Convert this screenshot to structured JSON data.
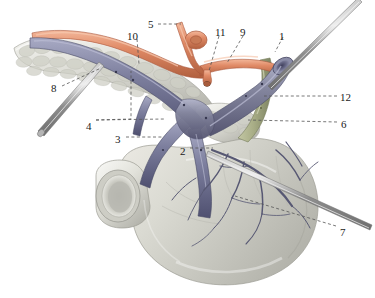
{
  "figure": {
    "background_color": "#ffffff",
    "width": 375,
    "height": 298
  },
  "palette": {
    "artery": "#e08a66",
    "artery_shadow": "#b8603f",
    "artery_highlight": "#f0b093",
    "vein": "#7d7f9e",
    "vein_shadow": "#4e4f6b",
    "vein_highlight": "#a6a8c2",
    "bile_duct": "#a8ad86",
    "bile_duct_shadow": "#7e8462",
    "organ": "#d9d9d2",
    "organ_shadow": "#b0b0a8",
    "organ_highlight": "#f2f2ee",
    "pancreas_lobule": "#cfd0c6",
    "probe": "#9a9a9a",
    "probe_highlight": "#dcdcdc",
    "leader_line": "#555555",
    "label_text": "#1a1a1a"
  },
  "labels": [
    {
      "id": "label-5",
      "text": "5",
      "x": 148,
      "y": 19
    },
    {
      "id": "label-10",
      "text": "10",
      "x": 127,
      "y": 31
    },
    {
      "id": "label-11",
      "text": "11",
      "x": 215,
      "y": 27
    },
    {
      "id": "label-9",
      "text": "9",
      "x": 240,
      "y": 27
    },
    {
      "id": "label-1",
      "text": "1",
      "x": 279,
      "y": 31
    },
    {
      "id": "label-12",
      "text": "12",
      "x": 340,
      "y": 92
    },
    {
      "id": "label-6",
      "text": "6",
      "x": 341,
      "y": 119
    },
    {
      "id": "label-8",
      "text": "8",
      "x": 51,
      "y": 83
    },
    {
      "id": "label-4",
      "text": "4",
      "x": 86,
      "y": 121
    },
    {
      "id": "label-3",
      "text": "3",
      "x": 115,
      "y": 134
    },
    {
      "id": "label-2",
      "text": "2",
      "x": 180,
      "y": 146
    },
    {
      "id": "label-7",
      "text": "7",
      "x": 340,
      "y": 227
    }
  ],
  "leader_lines": [
    {
      "id": "leader-5",
      "points": "158,24 181,24"
    },
    {
      "id": "leader-10",
      "points": "137,39 139,64"
    },
    {
      "id": "leader-11",
      "points": "219,36 209,71"
    },
    {
      "id": "leader-9",
      "points": "243,36 227,63"
    },
    {
      "id": "leader-1",
      "points": "283,37 275,52"
    },
    {
      "id": "leader-12",
      "points": "337,96 264,96"
    },
    {
      "id": "leader-6",
      "points": "337,122 248,120"
    },
    {
      "id": "leader-8",
      "points": "62,86 101,68"
    },
    {
      "id": "leader-4a",
      "points": "96,120 131,119 131,71"
    },
    {
      "id": "leader-4b",
      "points": "96,120 165,119"
    },
    {
      "id": "leader-3",
      "points": "126,137 163,137"
    },
    {
      "id": "leader-2",
      "points": "190,148 213,148"
    },
    {
      "id": "leader-7",
      "points": "336,226 235,196"
    }
  ],
  "structures": [
    {
      "id": "pancreas-body-tail",
      "name": "pancreas",
      "color": "#d9d9d2"
    },
    {
      "id": "duodenum",
      "name": "duodenum",
      "color": "#d9d9d2"
    },
    {
      "id": "splenic-artery",
      "name": "artery",
      "color": "#e08a66"
    },
    {
      "id": "portal-vein",
      "name": "vein",
      "color": "#7d7f9e"
    },
    {
      "id": "splenic-vein",
      "name": "vein",
      "color": "#7d7f9e"
    },
    {
      "id": "superior-mesenteric-vein",
      "name": "vein",
      "color": "#7d7f9e"
    },
    {
      "id": "common-bile-duct",
      "name": "bile duct",
      "color": "#a8ad86"
    },
    {
      "id": "probe-left",
      "name": "probe",
      "color": "#9a9a9a"
    },
    {
      "id": "probe-right-upper",
      "name": "probe",
      "color": "#9a9a9a"
    },
    {
      "id": "probe-right-lower",
      "name": "probe",
      "color": "#9a9a9a"
    }
  ]
}
